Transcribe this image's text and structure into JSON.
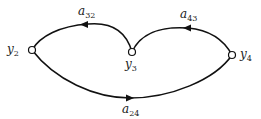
{
  "diagram": {
    "type": "signal-flow-graph",
    "nodes": [
      {
        "id": "y2",
        "base": "y",
        "sub": "2",
        "x": 32,
        "y": 50
      },
      {
        "id": "y3",
        "base": "y",
        "sub": "3",
        "x": 132,
        "y": 52
      },
      {
        "id": "y4",
        "base": "y",
        "sub": "4",
        "x": 232,
        "y": 55
      }
    ],
    "edges": [
      {
        "id": "a32",
        "from": "y3",
        "to": "y2",
        "base": "a",
        "sub": "32"
      },
      {
        "id": "a43",
        "from": "y4",
        "to": "y3",
        "base": "a",
        "sub": "43"
      },
      {
        "id": "a24",
        "from": "y2",
        "to": "y4",
        "base": "a",
        "sub": "24"
      }
    ],
    "colors": {
      "line": "#111111",
      "node_fill": "#ffffff",
      "background": "#ffffff"
    }
  }
}
